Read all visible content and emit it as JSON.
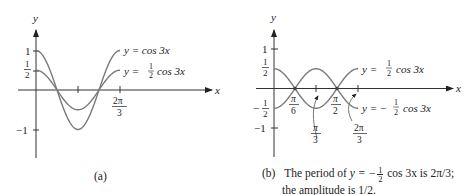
{
  "chart_data": [
    {
      "type": "line",
      "panel": "a",
      "caption": "(a)",
      "x_axis_label": "x",
      "y_axis_label": "y",
      "y_ticks": [
        {
          "value": 1,
          "label": "1"
        },
        {
          "value": 0.5,
          "label": "1/2"
        },
        {
          "value": -1,
          "label": "−1"
        }
      ],
      "x_ticks": [
        {
          "value": 1.0472,
          "label": "π/3",
          "show_label": false
        },
        {
          "value": 2.0944,
          "label": "2π/3",
          "show_label": true
        }
      ],
      "xlim": [
        0,
        2.0944
      ],
      "ylim": [
        -1,
        1
      ],
      "series": [
        {
          "name": "y = cos 3x",
          "amplitude": 1,
          "frequency": 3
        },
        {
          "name": "y = ½ cos 3x",
          "amplitude": 0.5,
          "frequency": 3
        }
      ]
    },
    {
      "type": "line",
      "panel": "b",
      "caption": "(b)",
      "caption_text_line1_prefix": "The period of",
      "caption_text_line1_eq": "y = −",
      "caption_text_line1_suffix": "cos 3x is 2π/3;",
      "caption_text_line2": "the amplitude is 1/2.",
      "x_axis_label": "x",
      "y_axis_label": "y",
      "y_ticks": [
        {
          "value": 1,
          "label": "1"
        },
        {
          "value": 0.5,
          "label": "1/2"
        },
        {
          "value": -0.5,
          "label": "−1/2"
        },
        {
          "value": -1,
          "label": "−1"
        }
      ],
      "x_ticks": [
        {
          "value": 0.5236,
          "label": "π/6"
        },
        {
          "value": 1.0472,
          "label": "π/3"
        },
        {
          "value": 1.5708,
          "label": "π/2"
        },
        {
          "value": 2.0944,
          "label": "2π/3"
        }
      ],
      "xlim": [
        0,
        2.0944
      ],
      "ylim": [
        -1,
        1
      ],
      "series": [
        {
          "name": "y = ½ cos 3x",
          "amplitude": 0.5,
          "frequency": 3
        },
        {
          "name": "y = −½ cos 3x",
          "amplitude": -0.5,
          "frequency": 3
        }
      ]
    }
  ],
  "panel_a": {
    "caption": "(a)",
    "legend": {
      "cos3x": "y = cos 3x",
      "half_prefix": "y =",
      "half_suffix": "cos 3x"
    },
    "ticks": {
      "one": "1",
      "neg_one": "−1",
      "half_num": "1",
      "half_den": "2",
      "two_pi": "2π",
      "three": "3"
    },
    "axis": {
      "x": "x",
      "y": "y"
    }
  },
  "panel_b": {
    "caption_label": "(b)",
    "caption_line1_a": "The period of",
    "caption_line1_b": "y = −",
    "caption_frac_num": "1",
    "caption_frac_den": "2",
    "caption_line1_c": "cos 3x is 2π/3;",
    "caption_line2": "the amplitude is 1/2.",
    "legend": {
      "pos_prefix": "y =",
      "pos_suffix": "cos 3x",
      "neg_prefix": "y = −",
      "neg_suffix": "cos 3x"
    },
    "ticks": {
      "one": "1",
      "neg_one": "−1",
      "half_num": "1",
      "half_den": "2",
      "neg_sign": "−",
      "pi": "π",
      "two_pi": "2π",
      "six": "6",
      "three": "3",
      "two": "2"
    },
    "axis": {
      "x": "x",
      "y": "y"
    }
  }
}
